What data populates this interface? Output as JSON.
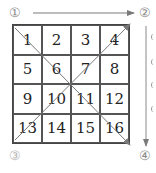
{
  "labels": {
    "c1": "①",
    "c2": "②",
    "c3": "③",
    "c4": "④"
  },
  "grid": {
    "cells": [
      "1",
      "2",
      "3",
      "4",
      "5",
      "6",
      "7",
      "8",
      "9",
      "10",
      "11",
      "12",
      "13",
      "14",
      "15",
      "16"
    ]
  },
  "arrows": [
    {
      "name": "top-arrow",
      "from": "①",
      "to": "②",
      "direction": "right"
    },
    {
      "name": "right-arrow",
      "from": "②",
      "to": "④",
      "direction": "down"
    },
    {
      "name": "diagonal-arrow-main",
      "from": "cell-1",
      "to": "cell-16",
      "direction": "down-right"
    },
    {
      "name": "diagonal-arrow-anti",
      "from": "cell-13",
      "to": "cell-4",
      "direction": "up-right"
    }
  ],
  "colors": {
    "grid_line": "#444444",
    "arrow": "#7a7a7a",
    "text": "#222222",
    "circled_label": "#8a8a8a"
  }
}
